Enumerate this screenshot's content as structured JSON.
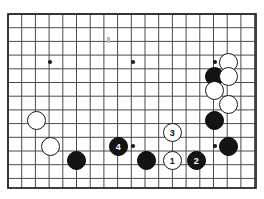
{
  "diagram": {
    "board": {
      "type": "go-goban-partial",
      "visible_columns": 18,
      "visible_rows": 13,
      "grid_spacing_px": 13.7,
      "origin_x_px": 8,
      "origin_y_px": 14,
      "right_edge_px": 256,
      "bottom_edge_px": 188,
      "line_color": "#4a4a4a",
      "border_color": "#2b2b2b",
      "background_color": "#ffffff",
      "star_point_color": "#1a1a1a"
    },
    "star_points": [
      {
        "name": "hoshi-upper-left",
        "x": 50,
        "y": 62
      },
      {
        "name": "hoshi-upper-center",
        "x": 133,
        "y": 62
      },
      {
        "name": "hoshi-upper-right",
        "x": 215,
        "y": 62
      },
      {
        "name": "hoshi-lower-center",
        "x": 133,
        "y": 146
      },
      {
        "name": "hoshi-lower-right",
        "x": 215,
        "y": 146
      }
    ],
    "faint_mark": {
      "name": "faint-mark",
      "x": 107,
      "y": 37,
      "w": 3,
      "h": 6
    },
    "stones": [
      {
        "id": "w-upper-right-1",
        "color": "white",
        "label": "",
        "x": 228,
        "y": 62,
        "r": 9.5
      },
      {
        "id": "b-upper-right-1",
        "color": "black",
        "label": "",
        "x": 214,
        "y": 76,
        "r": 9.5
      },
      {
        "id": "w-upper-right-2",
        "color": "white",
        "label": "",
        "x": 228,
        "y": 76,
        "r": 9.5
      },
      {
        "id": "w-upper-right-3",
        "color": "white",
        "label": "",
        "x": 214,
        "y": 90,
        "r": 9.5
      },
      {
        "id": "w-upper-right-4",
        "color": "white",
        "label": "",
        "x": 228,
        "y": 104,
        "r": 9.5
      },
      {
        "id": "b-right-1",
        "color": "black",
        "label": "",
        "x": 214,
        "y": 120,
        "r": 9.5
      },
      {
        "id": "b-right-2",
        "color": "black",
        "label": "",
        "x": 228,
        "y": 146,
        "r": 9.5
      },
      {
        "id": "w-left-1",
        "color": "white",
        "label": "",
        "x": 36,
        "y": 120,
        "r": 9.5
      },
      {
        "id": "w-left-2",
        "color": "white",
        "label": "",
        "x": 50,
        "y": 146,
        "r": 9.5
      },
      {
        "id": "b-bottom-1",
        "color": "black",
        "label": "",
        "x": 76,
        "y": 160,
        "r": 9.5
      },
      {
        "id": "b-move-4",
        "color": "black",
        "label": "4",
        "x": 118,
        "y": 146,
        "r": 9.5
      },
      {
        "id": "b-bottom-2",
        "color": "black",
        "label": "",
        "x": 146,
        "y": 160,
        "r": 9.5
      },
      {
        "id": "w-move-3",
        "color": "white",
        "label": "3",
        "x": 172,
        "y": 132,
        "r": 9.5
      },
      {
        "id": "w-move-1",
        "color": "white",
        "label": "1",
        "x": 172,
        "y": 160,
        "r": 9.5
      },
      {
        "id": "b-move-2",
        "color": "black",
        "label": "2",
        "x": 196,
        "y": 160,
        "r": 9.5
      }
    ],
    "move_sequence": [
      {
        "number": "1",
        "color": "white"
      },
      {
        "number": "2",
        "color": "black"
      },
      {
        "number": "3",
        "color": "white"
      },
      {
        "number": "4",
        "color": "black"
      }
    ]
  }
}
